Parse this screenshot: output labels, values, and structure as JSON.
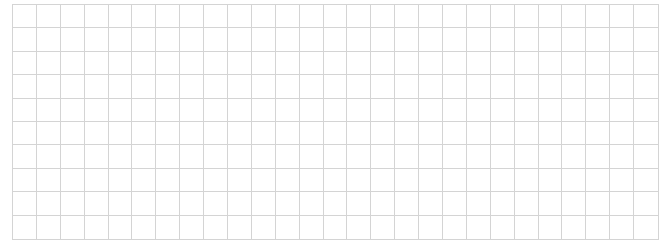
{
  "grid": {
    "columns": 27,
    "rows": 10,
    "line_color": "#d4d4d4",
    "background": "#ffffff",
    "cells_filled": 0
  }
}
